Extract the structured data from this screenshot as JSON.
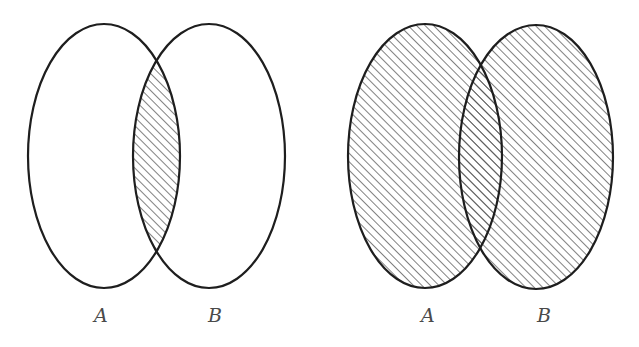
{
  "diagrams": [
    {
      "id": "intersection",
      "description": "A ∩ B — only the overlapping region is shaded",
      "shaded_region": "intersection",
      "sets": [
        {
          "label": "A",
          "cx": 104,
          "cy": 156,
          "rx": 76,
          "ry": 132,
          "label_x": 94,
          "label_y": 322
        },
        {
          "label": "B",
          "cx": 209,
          "cy": 156,
          "rx": 76,
          "ry": 132,
          "label_x": 208,
          "label_y": 322
        }
      ]
    },
    {
      "id": "union",
      "description": "A ∪ B — both sets fully shaded",
      "shaded_region": "union",
      "sets": [
        {
          "label": "A",
          "cx": 425,
          "cy": 156,
          "rx": 77,
          "ry": 132,
          "label_x": 421,
          "label_y": 322
        },
        {
          "label": "B",
          "cx": 536,
          "cy": 157,
          "rx": 77,
          "ry": 132,
          "label_x": 537,
          "label_y": 322
        }
      ]
    }
  ],
  "style": {
    "outline_color": "#1e1e1e",
    "hatch_color": "#4a4a4a",
    "label_color": "#4a4a4a",
    "hatch_angle_deg": 45,
    "hatch_spacing_px": 6
  }
}
